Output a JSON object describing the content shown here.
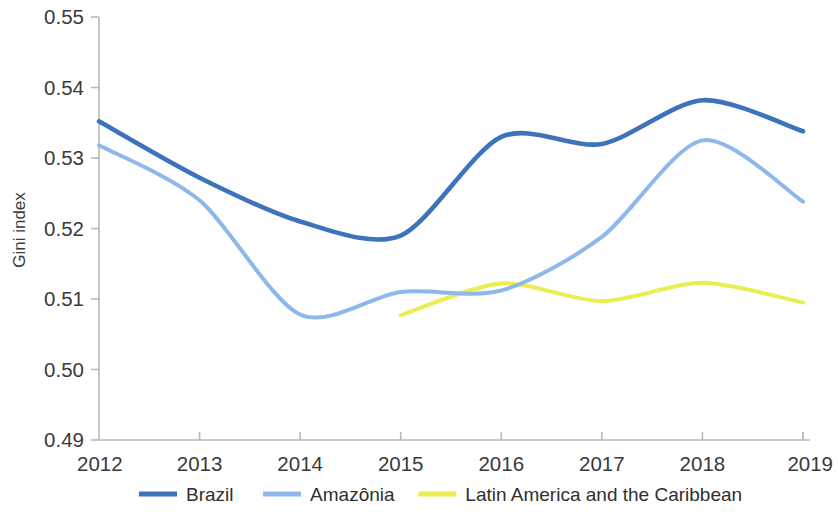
{
  "chart_data": {
    "type": "line",
    "title": "",
    "xlabel": "",
    "ylabel": "Gini index",
    "x": [
      2012,
      2013,
      2014,
      2015,
      2016,
      2017,
      2018,
      2019
    ],
    "xlim": [
      2012,
      2019
    ],
    "ylim": [
      0.49,
      0.55
    ],
    "y_ticks": [
      0.49,
      0.5,
      0.51,
      0.52,
      0.53,
      0.54,
      0.55
    ],
    "y_tick_labels": [
      "0.49",
      "0.50",
      "0.51",
      "0.52",
      "0.53",
      "0.54",
      "0.55"
    ],
    "x_tick_labels": [
      "2012",
      "2013",
      "2014",
      "2015",
      "2016",
      "2017",
      "2018",
      "2019"
    ],
    "grid": false,
    "legend_position": "bottom",
    "series": [
      {
        "name": "Brazil",
        "color": "#3d72bc",
        "x": [
          2012,
          2013,
          2014,
          2015,
          2016,
          2017,
          2018,
          2019
        ],
        "values": [
          0.5352,
          0.5272,
          0.521,
          0.519,
          0.533,
          0.532,
          0.5382,
          0.5338
        ]
      },
      {
        "name": "Amazônia",
        "color": "#8fb8ea",
        "x": [
          2012,
          2013,
          2014,
          2015,
          2016,
          2017,
          2018,
          2019
        ],
        "values": [
          0.5318,
          0.524,
          0.5078,
          0.511,
          0.5112,
          0.5188,
          0.5325,
          0.5238
        ]
      },
      {
        "name": "Latin America and the Caribbean",
        "color": "#eced52",
        "x": [
          2015,
          2016,
          2017,
          2018,
          2019
        ],
        "values": [
          0.5077,
          0.5122,
          0.5097,
          0.5123,
          0.5095
        ]
      }
    ]
  },
  "axes": {
    "y_title": "Gini index"
  },
  "legend": {
    "items": [
      {
        "label": "Brazil",
        "color": "#3d72bc"
      },
      {
        "label": "Amazônia",
        "color": "#8fb8ea"
      },
      {
        "label": "Latin America and the Caribbean",
        "color": "#eced52"
      }
    ]
  }
}
